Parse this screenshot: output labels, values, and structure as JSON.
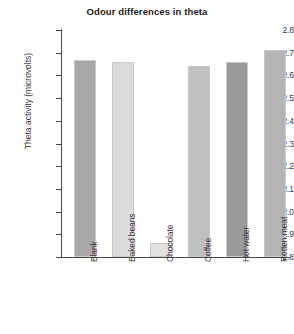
{
  "chart_data": {
    "type": "bar",
    "title": "Odour differences in theta",
    "xlabel": "",
    "ylabel": "Theta activity (microvolts)",
    "categories": [
      "Blank",
      "Baked beans",
      "Chocolate",
      "Coffee",
      "Hot water",
      "Rotten meat"
    ],
    "values": [
      2.67,
      2.66,
      1.86,
      2.64,
      2.66,
      2.71
    ],
    "ylim": [
      1.8,
      2.8
    ],
    "ytick_labels": [
      "2.8",
      "2.7",
      "2.6",
      "2.5",
      "2.4",
      "2.3",
      "2.2",
      "2.1",
      "2.0",
      "1.9",
      "1.8"
    ],
    "ytick_values": [
      2.8,
      2.7,
      2.6,
      2.5,
      2.4,
      2.3,
      2.2,
      2.1,
      2.0,
      1.9,
      1.8
    ],
    "grid": false,
    "legend": false,
    "bar_colors": [
      "#a8a8a8",
      "#dcdcdc",
      "#e2e2e2",
      "#bfbfbf",
      "#9a9a9a",
      "#b5b5b5"
    ],
    "axis_color": "#4a4a4a",
    "background": "#ffffff"
  }
}
